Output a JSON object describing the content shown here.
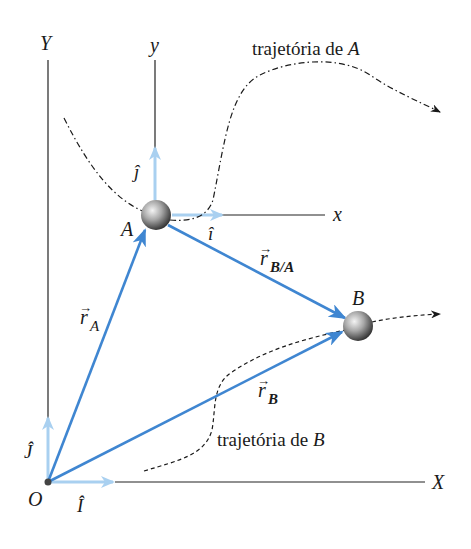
{
  "diagram": {
    "colors": {
      "axis": "#222222",
      "position_vector": "#3f86d1",
      "unit_vector": "#a9d0f0",
      "trajectory": "#1a1a1a",
      "particle": "#9a9a9a"
    },
    "fixed_frame": {
      "origin_label": "O",
      "x_label": "X",
      "y_label": "Y",
      "unit_x_label": "Î",
      "unit_y_label": "Ĵ"
    },
    "moving_frame": {
      "x_label": "x",
      "y_label": "y",
      "unit_x_label": "î",
      "unit_y_label": "ĵ"
    },
    "particles": [
      {
        "id": "A",
        "label": "A"
      },
      {
        "id": "B",
        "label": "B"
      }
    ],
    "vectors": {
      "r_A": {
        "symbol": "r",
        "subscript": "A"
      },
      "r_B": {
        "symbol": "r",
        "subscript": "B"
      },
      "r_BA": {
        "symbol": "r",
        "subscript": "B/A"
      }
    },
    "trajectories": {
      "A": {
        "label_text": "trajetória de ",
        "label_particle": "A"
      },
      "B": {
        "label_text": "trajetória de ",
        "label_particle": "B"
      }
    }
  }
}
